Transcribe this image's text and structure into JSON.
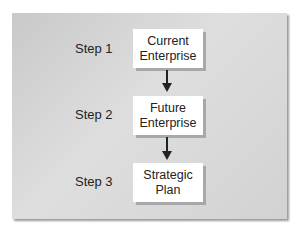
{
  "diagram": {
    "steps": [
      {
        "label": "Step 1",
        "box_line1": "Current",
        "box_line2": "Enterprise"
      },
      {
        "label": "Step 2",
        "box_line1": "Future",
        "box_line2": "Enterprise"
      },
      {
        "label": "Step 3",
        "box_line1": "Strategic",
        "box_line2": "Plan"
      }
    ]
  }
}
